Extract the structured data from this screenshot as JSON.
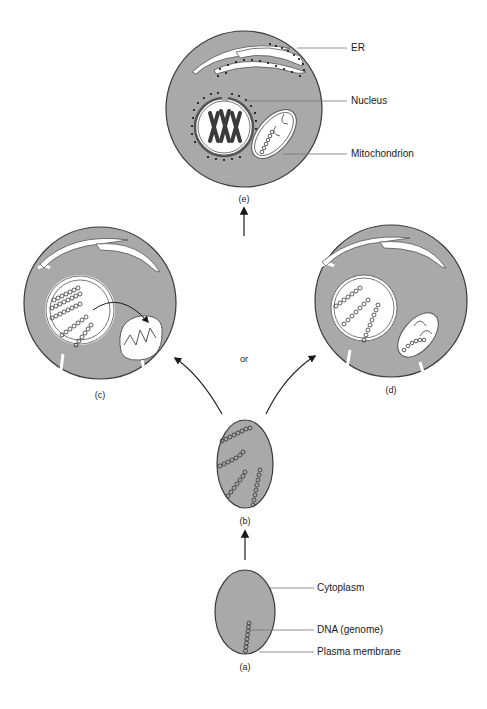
{
  "diagram": {
    "title": "",
    "colors": {
      "cytoplasm": "#a9a9a9",
      "membrane": "#3a3a3a",
      "interior": "#ffffff",
      "text": "#1a1a1a",
      "leader_line": "#777777"
    },
    "panels": {
      "a": {
        "caption": "(a)"
      },
      "b": {
        "caption": "(b)"
      },
      "c": {
        "caption": "(c)"
      },
      "d": {
        "caption": "(d)"
      },
      "e": {
        "caption": "(e)"
      }
    },
    "labels": {
      "er": "ER",
      "nucleus": "Nucleus",
      "mitochondrion": "Mitochondrion",
      "cytoplasm": "Cytoplasm",
      "dna": "DNA (genome)",
      "plasma_membrane": "Plasma membrane"
    },
    "connector_text": "or"
  }
}
